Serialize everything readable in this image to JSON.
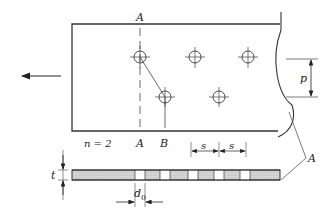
{
  "labels": {
    "section_A_top": "A",
    "section_A_bottom": "A",
    "section_B": "B",
    "pitch": "p",
    "bolt_rows": "n = 2",
    "spacing_1": "s",
    "spacing_2": "s",
    "thickness": "t",
    "hole_diameter": "d",
    "hole_diameter_sub": "0",
    "callout": "A"
  },
  "holes": {
    "top_row": [
      {
        "x": 140,
        "y": 57
      },
      {
        "x": 195,
        "y": 57
      },
      {
        "x": 248,
        "y": 57
      }
    ],
    "bottom_row": [
      {
        "x": 165,
        "y": 97
      },
      {
        "x": 219,
        "y": 97
      }
    ]
  },
  "bar_gaps": [
    [
      135,
      145
    ],
    [
      160,
      170
    ],
    [
      188,
      198
    ],
    [
      214,
      224
    ],
    [
      240,
      250
    ]
  ],
  "colors": {
    "line": "#333333",
    "hatch": "#cccccc"
  }
}
